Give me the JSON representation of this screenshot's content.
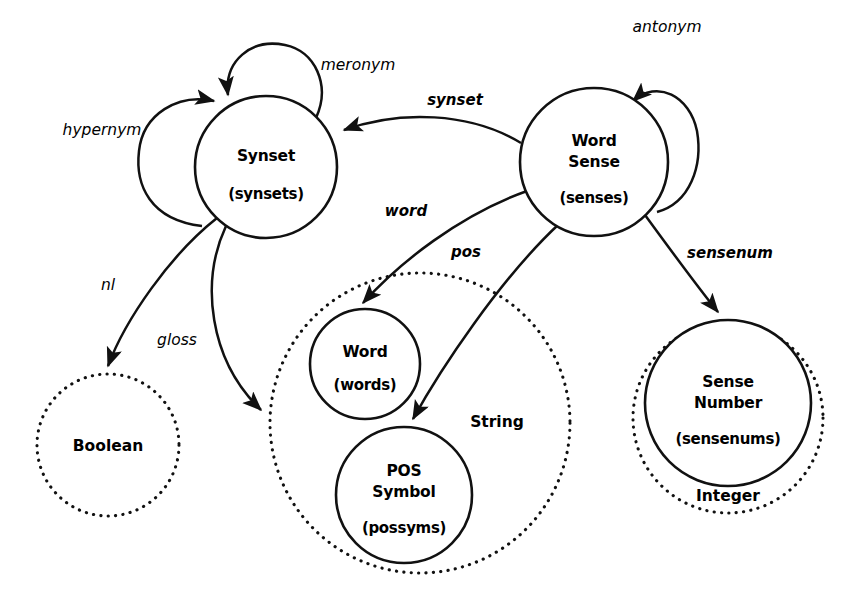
{
  "diagram": {
    "colors": {
      "stroke": "#111111",
      "fill": "#ffffff",
      "text": "#000000"
    },
    "entities": [
      {
        "id": "synset",
        "name": "Synset",
        "table": "(synsets)",
        "style": "solid",
        "cx": 266,
        "cy": 167,
        "r": 71
      },
      {
        "id": "wordsense",
        "name_line1": "Word",
        "name_line2": "Sense",
        "table": "(senses)",
        "style": "solid",
        "cx": 594,
        "cy": 162,
        "r": 74
      },
      {
        "id": "word",
        "name": "Word",
        "table": "(words)",
        "style": "solid",
        "cx": 365,
        "cy": 364,
        "r": 55
      },
      {
        "id": "possym",
        "name_line1": "POS",
        "name_line2": "Symbol",
        "table": "(possyms)",
        "style": "solid",
        "cx": 404,
        "cy": 495,
        "r": 68
      },
      {
        "id": "sensenumber",
        "name_line1": "Sense",
        "name_line2": "Number",
        "table": "(sensenums)",
        "style": "solid",
        "cx": 728,
        "cy": 403,
        "r": 83
      }
    ],
    "types": [
      {
        "id": "boolean",
        "label": "Boolean",
        "style": "dotted",
        "cx": 108,
        "cy": 445,
        "r": 71,
        "label_position": "center"
      },
      {
        "id": "string",
        "label": "String",
        "style": "dotted",
        "cx": 420,
        "cy": 423,
        "r": 150,
        "label_position": "inner-right"
      },
      {
        "id": "integer",
        "label": "Integer",
        "style": "dotted",
        "cx": 728,
        "cy": 418,
        "r": 95,
        "label_position": "inner-bottom"
      }
    ],
    "relations": [
      {
        "id": "hypernym",
        "label": "hypernym",
        "from": "synset",
        "to": "synset",
        "emphasis": "plain",
        "label_x": 102,
        "label_y": 135
      },
      {
        "id": "meronym",
        "label": "meronym",
        "from": "synset",
        "to": "synset",
        "emphasis": "plain",
        "label_x": 357,
        "label_y": 70
      },
      {
        "id": "antonym",
        "label": "antonym",
        "from": "wordsense",
        "to": "wordsense",
        "emphasis": "plain",
        "label_x": 667,
        "label_y": 32
      },
      {
        "id": "synset",
        "label": "synset",
        "from": "wordsense",
        "to": "synset",
        "emphasis": "bold",
        "label_x": 455,
        "label_y": 105
      },
      {
        "id": "word",
        "label": "word",
        "from": "wordsense",
        "to": "word",
        "emphasis": "bold",
        "label_x": 406,
        "label_y": 215
      },
      {
        "id": "pos",
        "label": "pos",
        "from": "wordsense",
        "to": "possym",
        "emphasis": "bold",
        "label_x": 466,
        "label_y": 256
      },
      {
        "id": "sensenum",
        "label": "sensenum",
        "from": "wordsense",
        "to": "sensenumber",
        "emphasis": "bold",
        "label_x": 729,
        "label_y": 257
      },
      {
        "id": "nl",
        "label": "nl",
        "from": "synset",
        "to": "boolean",
        "emphasis": "plain",
        "label_x": 108,
        "label_y": 288
      },
      {
        "id": "gloss",
        "label": "gloss",
        "from": "synset",
        "to": "string",
        "emphasis": "plain",
        "label_x": 177,
        "label_y": 344
      }
    ]
  }
}
